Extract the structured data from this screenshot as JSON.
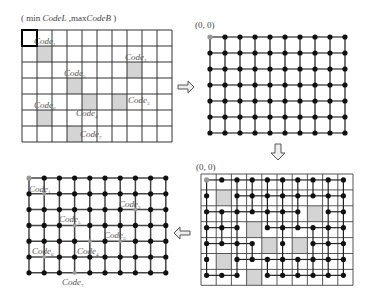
{
  "panels": {
    "top_left": {
      "title": "( min CodeL ,maxCodeB )",
      "title_parts": {
        "open": "( min ",
        "codeL": "CodeL",
        " sep": " ,max",
        "codeB": "CodeB",
        "close": " )"
      },
      "cols": 10,
      "rows": 7,
      "gray_cells": [
        [
          1,
          1
        ],
        [
          7,
          2
        ],
        [
          3,
          3
        ],
        [
          4,
          4
        ],
        [
          6,
          4
        ],
        [
          1,
          5
        ],
        [
          3,
          6
        ]
      ],
      "labels": [
        {
          "text": "Code",
          "sub": "1",
          "x": 34,
          "y": 44
        },
        {
          "text": "Code",
          "sub": "2",
          "x": 125,
          "y": 60
        },
        {
          "text": "Code",
          "sub": "5",
          "x": 64,
          "y": 76
        },
        {
          "text": "Code",
          "sub": "3",
          "x": 128,
          "y": 103
        },
        {
          "text": "Code",
          "sub": "6",
          "x": 34,
          "y": 108
        },
        {
          "text": "Code",
          "sub": "4",
          "x": 76,
          "y": 116
        },
        {
          "text": "Code",
          "sub": "7",
          "x": 80,
          "y": 137
        }
      ]
    },
    "top_right": {
      "origin_label": "(0, 0)",
      "cols": 10,
      "rows": 7
    },
    "bottom_right": {
      "origin_label": "(0, 0)",
      "cols": 10,
      "rows": 7,
      "gray_cells": [
        [
          1,
          1
        ],
        [
          7,
          2
        ],
        [
          3,
          3
        ],
        [
          4,
          4
        ],
        [
          6,
          4
        ],
        [
          1,
          5
        ],
        [
          3,
          6
        ]
      ]
    },
    "bottom_left": {
      "cols": 10,
      "rows": 7,
      "labels": [
        {
          "text": "Code",
          "sub": "1",
          "x": 29,
          "y": 192
        },
        {
          "text": "Code",
          "sub": "2",
          "x": 119,
          "y": 207
        },
        {
          "text": "Code",
          "sub": "5",
          "x": 59,
          "y": 222
        },
        {
          "text": "Code",
          "sub": "3",
          "x": 104,
          "y": 238
        },
        {
          "text": "Code",
          "sub": "6",
          "x": 32,
          "y": 254
        },
        {
          "text": "Code",
          "sub": "4",
          "x": 77,
          "y": 254
        },
        {
          "text": "Code",
          "sub": "7",
          "x": 62,
          "y": 285
        }
      ]
    }
  },
  "arrows": [
    {
      "direction": "right",
      "from": "top_left",
      "to": "top_right"
    },
    {
      "direction": "down",
      "from": "top_right",
      "to": "bottom_right"
    },
    {
      "direction": "left",
      "from": "bottom_right",
      "to": "bottom_left"
    }
  ],
  "colors": {
    "node": "#111111",
    "origin_node": "#999999",
    "gray_cell": "#d4d4d4",
    "grid": "#333333"
  }
}
